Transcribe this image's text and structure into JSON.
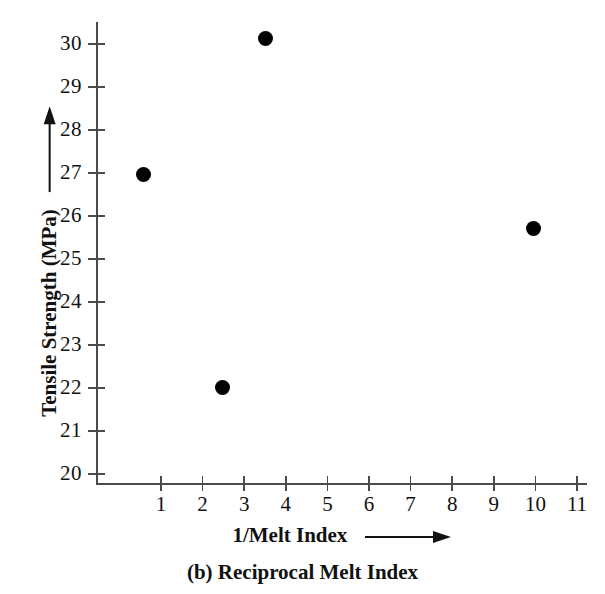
{
  "chart_data": {
    "type": "scatter",
    "title": "",
    "caption": "(b) Reciprocal Melt Index",
    "xlabel": "1/Melt Index",
    "ylabel": "Tensile Strength (MPa)",
    "xlabel_arrow": "right-arrow",
    "ylabel_arrow": "up-arrow",
    "xlim": [
      0,
      11.8
    ],
    "ylim": [
      19.75,
      30.5
    ],
    "xticks": [
      1,
      2,
      3,
      4,
      5,
      6,
      7,
      8,
      9,
      10,
      11
    ],
    "yticks": [
      20,
      21,
      22,
      23,
      24,
      25,
      26,
      27,
      28,
      29,
      30
    ],
    "xticklabels": [
      "1",
      "2",
      "3",
      "4",
      "5",
      "6",
      "7",
      "8",
      "9",
      "10",
      "11"
    ],
    "yticklabels": [
      "20",
      "21",
      "22",
      "23",
      "24",
      "25",
      "26",
      "27",
      "28",
      "29",
      "30"
    ],
    "grid": false,
    "legend": null,
    "marker": "filled-circle",
    "marker_color": "#000000",
    "axis_color": "#4a4a4a",
    "points": [
      {
        "x": 0.57,
        "y": 26.97
      },
      {
        "x": 2.49,
        "y": 22.02
      },
      {
        "x": 3.52,
        "y": 30.12
      },
      {
        "x": 9.95,
        "y": 25.72
      }
    ]
  }
}
